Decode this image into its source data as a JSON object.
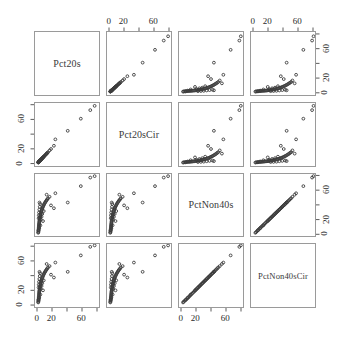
{
  "figure": {
    "type": "scatterplot-matrix",
    "variables": [
      "Pct20s",
      "Pct20sCir",
      "PctNon40s",
      "PctNon40sCir"
    ],
    "n_vars": 4,
    "background_color": "#ffffff",
    "panel_border_color": "#9a9a9a",
    "point_color": "#3c3c3c",
    "point_symbol": "open-circle"
  },
  "diagonal": {
    "labels": [
      "Pct20s",
      "Pct20sCir",
      "PctNon40s",
      "PctNon40sCir"
    ]
  },
  "axes": {
    "tick_values": [
      0,
      20,
      40,
      60,
      80
    ],
    "labeled_ticks": [
      0,
      20,
      60
    ],
    "tick_labels": [
      "0",
      "20",
      "60"
    ],
    "range": [
      -4,
      84
    ],
    "top_axis_columns": [
      2,
      4
    ],
    "bottom_axis_columns": [
      1,
      3
    ],
    "left_axis_rows": [
      2,
      4
    ],
    "right_axis_rows": [
      1,
      3
    ]
  },
  "chart_data": {
    "type": "scatter",
    "title": "",
    "xlabel": "",
    "ylabel": "",
    "variables": [
      "Pct20s",
      "Pct20sCir",
      "PctNon40s",
      "PctNon40sCir"
    ],
    "axis_range": [
      -4,
      84
    ],
    "tick_labels": [
      "0",
      "20",
      "60"
    ],
    "tick_values": [
      0,
      20,
      60
    ],
    "grid": false,
    "legend": "none",
    "observations": [
      {
        "Pct20s": 0.4,
        "Pct20sCir": 0.5,
        "PctNon40s": 1.5,
        "PctNon40sCir": 2.0
      },
      {
        "Pct20s": 0.6,
        "Pct20sCir": 0.7,
        "PctNon40s": 2.4,
        "PctNon40sCir": 2.9
      },
      {
        "Pct20s": 0.8,
        "Pct20sCir": 0.9,
        "PctNon40s": 3.6,
        "PctNon40sCir": 4.1
      },
      {
        "Pct20s": 0.9,
        "Pct20sCir": 1.1,
        "PctNon40s": 5.0,
        "PctNon40sCir": 5.4
      },
      {
        "Pct20s": 1.0,
        "Pct20sCir": 1.2,
        "PctNon40s": 6.2,
        "PctNon40sCir": 6.6
      },
      {
        "Pct20s": 1.1,
        "Pct20sCir": 1.3,
        "PctNon40s": 7.5,
        "PctNon40sCir": 7.9
      },
      {
        "Pct20s": 1.2,
        "Pct20sCir": 1.4,
        "PctNon40s": 8.8,
        "PctNon40sCir": 9.2
      },
      {
        "Pct20s": 1.3,
        "Pct20sCir": 1.5,
        "PctNon40s": 10.0,
        "PctNon40sCir": 10.4
      },
      {
        "Pct20s": 1.4,
        "Pct20sCir": 1.6,
        "PctNon40s": 11.2,
        "PctNon40sCir": 11.7
      },
      {
        "Pct20s": 1.5,
        "Pct20sCir": 1.8,
        "PctNon40s": 12.5,
        "PctNon40sCir": 13.0
      },
      {
        "Pct20s": 1.6,
        "Pct20sCir": 1.9,
        "PctNon40s": 13.8,
        "PctNon40sCir": 14.3
      },
      {
        "Pct20s": 1.8,
        "Pct20sCir": 2.1,
        "PctNon40s": 15.0,
        "PctNon40sCir": 15.5
      },
      {
        "Pct20s": 1.9,
        "Pct20sCir": 2.2,
        "PctNon40s": 16.3,
        "PctNon40sCir": 16.8
      },
      {
        "Pct20s": 2.0,
        "Pct20sCir": 2.3,
        "PctNon40s": 17.5,
        "PctNon40sCir": 18.0
      },
      {
        "Pct20s": 2.2,
        "Pct20sCir": 2.5,
        "PctNon40s": 18.8,
        "PctNon40sCir": 19.3
      },
      {
        "Pct20s": 2.4,
        "Pct20sCir": 2.7,
        "PctNon40s": 20.0,
        "PctNon40sCir": 20.6
      },
      {
        "Pct20s": 2.6,
        "Pct20sCir": 2.9,
        "PctNon40s": 21.3,
        "PctNon40sCir": 21.9
      },
      {
        "Pct20s": 2.8,
        "Pct20sCir": 3.1,
        "PctNon40s": 22.5,
        "PctNon40sCir": 23.1
      },
      {
        "Pct20s": 3.0,
        "Pct20sCir": 3.4,
        "PctNon40s": 23.8,
        "PctNon40sCir": 24.4
      },
      {
        "Pct20s": 3.2,
        "Pct20sCir": 3.6,
        "PctNon40s": 25.0,
        "PctNon40sCir": 25.7
      },
      {
        "Pct20s": 3.5,
        "Pct20sCir": 3.9,
        "PctNon40s": 26.3,
        "PctNon40sCir": 27.0
      },
      {
        "Pct20s": 3.8,
        "Pct20sCir": 4.2,
        "PctNon40s": 27.5,
        "PctNon40sCir": 28.2
      },
      {
        "Pct20s": 4.0,
        "Pct20sCir": 4.4,
        "PctNon40s": 28.8,
        "PctNon40sCir": 29.5
      },
      {
        "Pct20s": 4.3,
        "Pct20sCir": 4.8,
        "PctNon40s": 30.0,
        "PctNon40sCir": 30.8
      },
      {
        "Pct20s": 4.6,
        "Pct20sCir": 5.1,
        "PctNon40s": 31.3,
        "PctNon40sCir": 32.1
      },
      {
        "Pct20s": 5.0,
        "Pct20sCir": 5.5,
        "PctNon40s": 32.5,
        "PctNon40sCir": 33.3
      },
      {
        "Pct20s": 5.4,
        "Pct20sCir": 5.9,
        "PctNon40s": 33.8,
        "PctNon40sCir": 34.6
      },
      {
        "Pct20s": 5.8,
        "Pct20sCir": 6.4,
        "PctNon40s": 35.0,
        "PctNon40sCir": 35.9
      },
      {
        "Pct20s": 6.2,
        "Pct20sCir": 6.8,
        "PctNon40s": 36.3,
        "PctNon40sCir": 37.2
      },
      {
        "Pct20s": 6.7,
        "Pct20sCir": 7.3,
        "PctNon40s": 37.5,
        "PctNon40sCir": 38.4
      },
      {
        "Pct20s": 7.2,
        "Pct20sCir": 7.9,
        "PctNon40s": 38.8,
        "PctNon40sCir": 39.7
      },
      {
        "Pct20s": 7.8,
        "Pct20sCir": 8.5,
        "PctNon40s": 40.0,
        "PctNon40sCir": 41.0
      },
      {
        "Pct20s": 8.4,
        "Pct20sCir": 9.2,
        "PctNon40s": 41.3,
        "PctNon40sCir": 42.3
      },
      {
        "Pct20s": 9.0,
        "Pct20sCir": 9.8,
        "PctNon40s": 42.5,
        "PctNon40sCir": 43.5
      },
      {
        "Pct20s": 9.8,
        "Pct20sCir": 10.6,
        "PctNon40s": 43.8,
        "PctNon40sCir": 44.8
      },
      {
        "Pct20s": 10.5,
        "Pct20sCir": 11.4,
        "PctNon40s": 45.0,
        "PctNon40sCir": 46.1
      },
      {
        "Pct20s": 11.3,
        "Pct20sCir": 12.2,
        "PctNon40s": 46.3,
        "PctNon40sCir": 47.4
      },
      {
        "Pct20s": 12.2,
        "Pct20sCir": 13.2,
        "PctNon40s": 47.5,
        "PctNon40sCir": 48.6
      },
      {
        "Pct20s": 13.0,
        "Pct20sCir": 14.1,
        "PctNon40s": 48.8,
        "PctNon40sCir": 49.9
      },
      {
        "Pct20s": 14.0,
        "Pct20sCir": 15.1,
        "PctNon40s": 50.0,
        "PctNon40sCir": 51.2
      },
      {
        "Pct20s": 1.0,
        "Pct20sCir": 1.2,
        "PctNon40s": 22.0,
        "PctNon40sCir": 23.0
      },
      {
        "Pct20s": 1.2,
        "Pct20sCir": 1.4,
        "PctNon40s": 26.0,
        "PctNon40sCir": 27.0
      },
      {
        "Pct20s": 1.5,
        "Pct20sCir": 1.7,
        "PctNon40s": 30.0,
        "PctNon40sCir": 31.0
      },
      {
        "Pct20s": 2.0,
        "Pct20sCir": 2.3,
        "PctNon40s": 34.0,
        "PctNon40sCir": 35.0
      },
      {
        "Pct20s": 2.5,
        "Pct20sCir": 2.8,
        "PctNon40s": 38.0,
        "PctNon40sCir": 39.0
      },
      {
        "Pct20s": 3.0,
        "Pct20sCir": 3.3,
        "PctNon40s": 42.0,
        "PctNon40sCir": 43.0
      },
      {
        "Pct20s": 4.0,
        "Pct20sCir": 4.4,
        "PctNon40s": 20.0,
        "PctNon40sCir": 21.0
      },
      {
        "Pct20s": 5.0,
        "Pct20sCir": 5.5,
        "PctNon40s": 24.0,
        "PctNon40sCir": 25.0
      },
      {
        "Pct20s": 6.0,
        "Pct20sCir": 6.6,
        "PctNon40s": 28.0,
        "PctNon40sCir": 29.0
      },
      {
        "Pct20s": 7.0,
        "Pct20sCir": 7.7,
        "PctNon40s": 18.0,
        "PctNon40sCir": 19.0
      },
      {
        "Pct20s": 8.0,
        "Pct20sCir": 8.7,
        "PctNon40s": 32.0,
        "PctNon40sCir": 33.0
      },
      {
        "Pct20s": 2.2,
        "Pct20sCir": 2.5,
        "PctNon40s": 44.0,
        "PctNon40sCir": 45.0
      },
      {
        "Pct20s": 3.4,
        "Pct20sCir": 3.7,
        "PctNon40s": 12.0,
        "PctNon40sCir": 13.0
      },
      {
        "Pct20s": 1.8,
        "Pct20sCir": 2.0,
        "PctNon40s": 8.0,
        "PctNon40sCir": 8.6
      },
      {
        "Pct20s": 0.7,
        "Pct20sCir": 0.8,
        "PctNon40s": 5.0,
        "PctNon40sCir": 5.5
      },
      {
        "Pct20s": 22.0,
        "Pct20sCir": 24.0,
        "PctNon40s": 36.0,
        "PctNon40sCir": 37.0
      },
      {
        "Pct20s": 24.0,
        "Pct20sCir": 33.0,
        "PctNon40s": 57.0,
        "PctNon40sCir": 58.0
      },
      {
        "Pct20s": 41.0,
        "Pct20sCir": 45.0,
        "PctNon40s": 44.0,
        "PctNon40sCir": 45.0
      },
      {
        "Pct20s": 59.0,
        "Pct20sCir": 62.0,
        "PctNon40s": 67.0,
        "PctNon40sCir": 68.0
      },
      {
        "Pct20s": 72.0,
        "Pct20sCir": 74.0,
        "PctNon40s": 79.0,
        "PctNon40sCir": 80.0
      },
      {
        "Pct20s": 78.0,
        "Pct20sCir": 80.0,
        "PctNon40s": 81.0,
        "PctNon40sCir": 82.0
      },
      {
        "Pct20s": 16.0,
        "Pct20sCir": 17.5,
        "PctNon40s": 52.0,
        "PctNon40sCir": 53.0
      },
      {
        "Pct20s": 18.0,
        "Pct20sCir": 19.5,
        "PctNon40s": 40.0,
        "PctNon40sCir": 41.0
      },
      {
        "Pct20s": 12.0,
        "Pct20sCir": 13.0,
        "PctNon40s": 55.0,
        "PctNon40sCir": 56.0
      }
    ]
  }
}
